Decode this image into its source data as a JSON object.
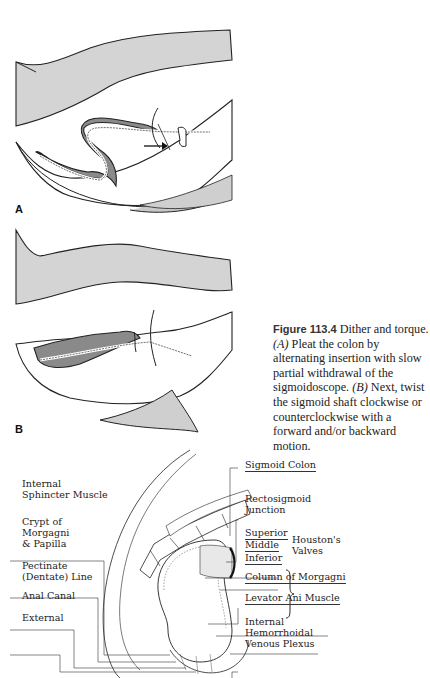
{
  "figure": {
    "panel_a": {
      "label": "A",
      "description": "Pleating colon by alternating insertion and partial withdrawal of sigmoidoscope"
    },
    "panel_b": {
      "label": "B",
      "description": "Twisting the sigmoid shaft with forward/backward motion"
    },
    "caption": {
      "figure_number": "Figure 113.4",
      "title": "Dither and torque.",
      "part_a_marker": "(A)",
      "part_a_text": "Pleat the colon by alternating insertion with slow partial withdrawal of the sigmoidoscope.",
      "part_b_marker": "(B)",
      "part_b_text": "Next, twist the sigmoid shaft clockwise or counterclockwise with a forward and/or backward motion."
    }
  },
  "anatomy": {
    "left_labels": [
      {
        "text": "Internal\nSphincter Muscle"
      },
      {
        "text": "Crypt of\nMorgagni\n& Papilla"
      },
      {
        "text": "Pectinate\n(Dentate) Line"
      },
      {
        "text": "Anal Canal"
      },
      {
        "text": "External"
      }
    ],
    "right_labels": [
      {
        "text": "Sigmoid Colon"
      },
      {
        "text": "Rectosigmoid\nJunction"
      },
      {
        "text": "Superior"
      },
      {
        "text": "Middle"
      },
      {
        "text": "Inferior"
      },
      {
        "text": "Column of Morgagni"
      },
      {
        "text": "Levator Ani Muscle"
      },
      {
        "text": "Internal\nHemorrhoidal\nVenous Plexus"
      }
    ],
    "bracket_label": "Houston's\nValves"
  }
}
